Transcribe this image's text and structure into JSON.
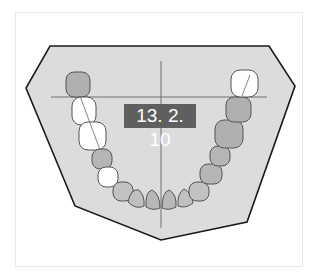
{
  "diagram": {
    "type": "dental-arch-occlusal-view",
    "jaw": "mandibular",
    "label": "13. 2. 10",
    "colors": {
      "plate_fill": "#dcdcdc",
      "plate_stroke": "#1a1a1a",
      "crosshair": "#707070",
      "label_bg": "#5f5f5f",
      "label_text": "#ffffff",
      "tooth_erupted_fill": "#b8b8b8",
      "tooth_unerupted_fill": "#ffffff"
    },
    "teeth": {
      "left_side_from_back": [
        "molar-erupted",
        "molar-unerupted",
        "molar-unerupted",
        "premolar-erupted",
        "premolar-unerupted",
        "canine-erupted"
      ],
      "incisors": [
        "incisor",
        "incisor",
        "incisor",
        "incisor"
      ],
      "right_side_from_back": [
        "molar-unerupted",
        "molar-erupted",
        "molar-erupted",
        "premolar-erupted",
        "premolar-erupted",
        "canine-erupted"
      ]
    }
  }
}
